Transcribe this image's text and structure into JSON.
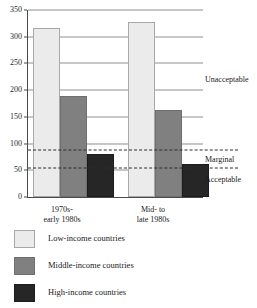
{
  "chart_data": {
    "type": "bar",
    "title": "",
    "subtitle": "",
    "xlabel": "",
    "ylabel": "",
    "ylim": [
      0,
      350
    ],
    "yticks": [
      0,
      50,
      100,
      150,
      200,
      250,
      300,
      350
    ],
    "ytick_labels": [
      "0",
      "50",
      "100",
      "150",
      "200",
      "250",
      "300",
      "350"
    ],
    "grid": "horizontal",
    "legend_position": "below-plot",
    "categories": [
      "1970s-\nearly 1980s",
      "Mid- to\nlate 1980s"
    ],
    "category_lines": [
      {
        "line1": "1970s-",
        "line2": "early 1980s"
      },
      {
        "line1": "Mid- to",
        "line2": "late 1980s"
      }
    ],
    "series": [
      {
        "name": "Low-income countries",
        "color": "#ebebeb",
        "values": [
          316,
          327
        ]
      },
      {
        "name": "Middle-income countries",
        "color": "#808080",
        "values": [
          190,
          162
        ]
      },
      {
        "name": "High-income countries",
        "color": "#262626",
        "values": [
          80,
          62
        ]
      }
    ],
    "threshold_lines": [
      {
        "label": "marginal-upper-threshold",
        "value": 88,
        "style": "dashed"
      },
      {
        "label": "acceptable-upper-threshold",
        "value": 55,
        "style": "dashed"
      }
    ],
    "zone_annotations": [
      {
        "label": "Unacceptable",
        "value": 220
      },
      {
        "label": "Marginal",
        "value": 71
      },
      {
        "label": "Acceptable",
        "value": 33
      }
    ]
  },
  "legend": {
    "items": [
      {
        "label": "Low-income countries",
        "swatch": "low"
      },
      {
        "label": "Middle-income countries",
        "swatch": "middle"
      },
      {
        "label": "High-income countries",
        "swatch": "high"
      }
    ]
  }
}
